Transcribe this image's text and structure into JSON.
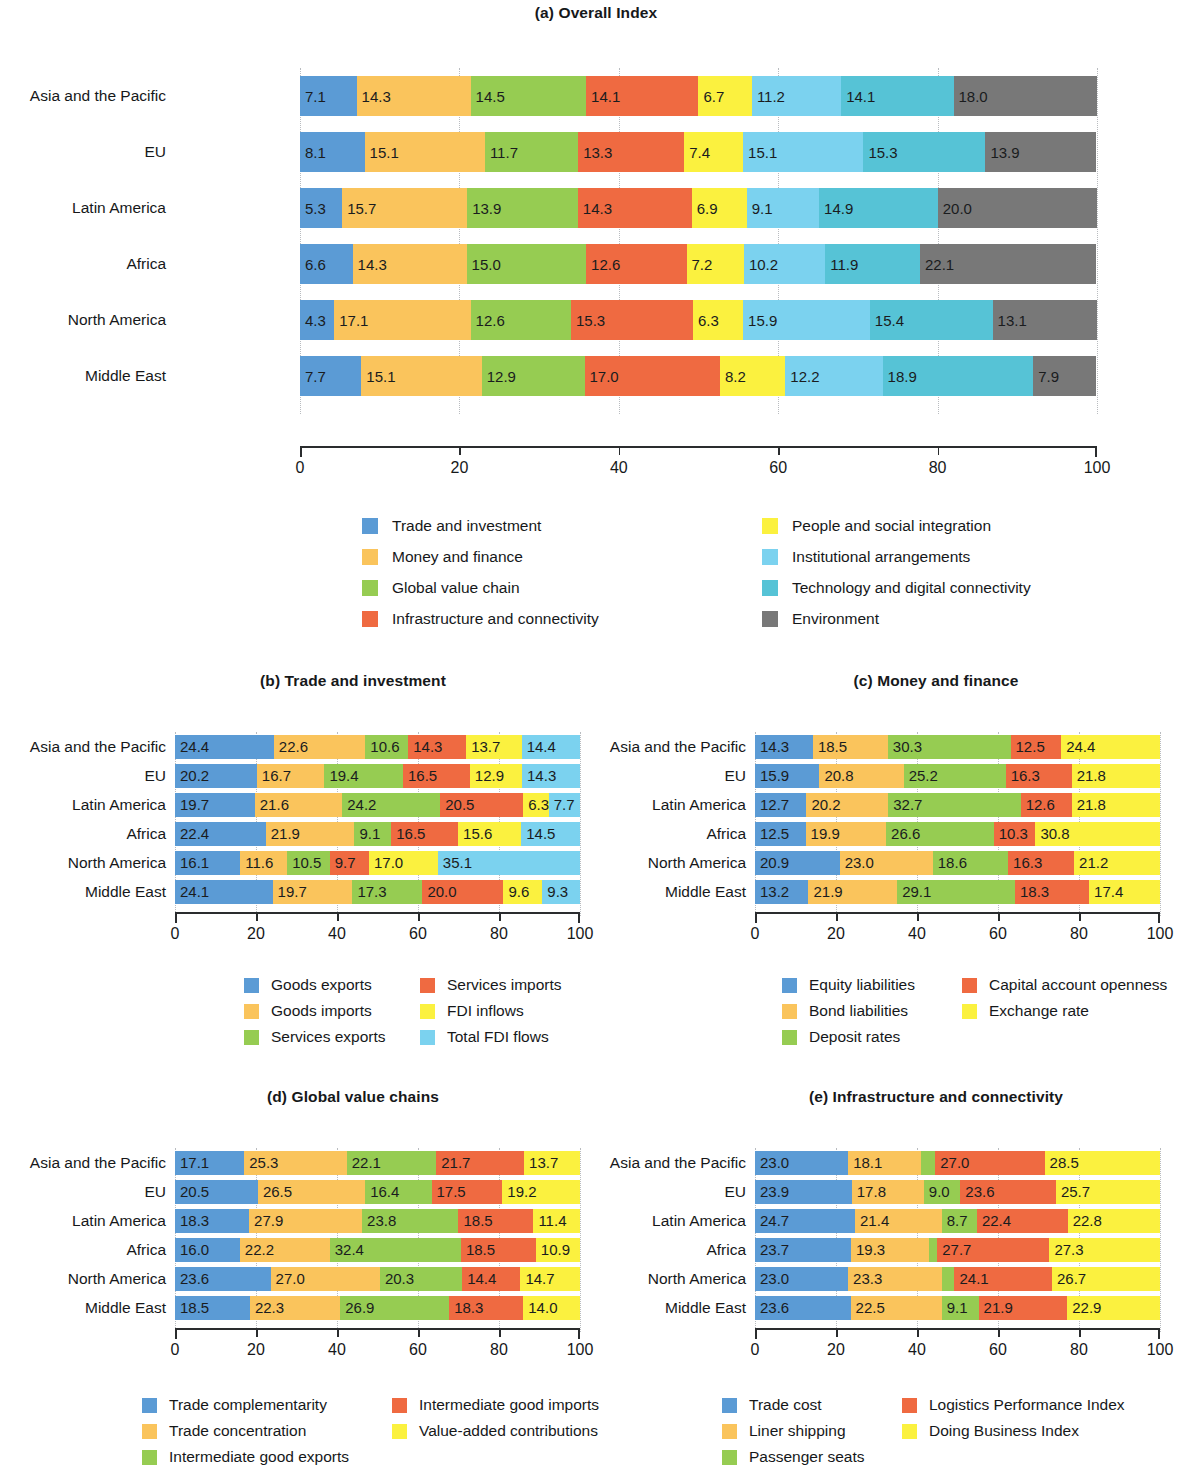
{
  "colors": {
    "blue": "#5b9bd5",
    "orange": "#fac45c",
    "green": "#96cc52",
    "red": "#ef6a41",
    "yellow": "#fbf13f",
    "lightblue": "#7bd2ef",
    "teal": "#56c3d6",
    "gray": "#787878"
  },
  "axis": {
    "ticks": [
      "0",
      "20",
      "40",
      "60",
      "80",
      "100"
    ],
    "min": 0,
    "max": 100
  },
  "regions": [
    "Asia and the Pacific",
    "EU",
    "Latin America",
    "Africa",
    "North America",
    "Middle East"
  ],
  "chart_data": [
    {
      "id": "a",
      "type": "bar",
      "orientation": "horizontal",
      "stacked": true,
      "title": "(a) Overall Index",
      "xlabel": "",
      "ylabel": "",
      "xlim": [
        0,
        100
      ],
      "grid": true,
      "legend_position": "below",
      "categories": [
        "Asia and the Pacific",
        "EU",
        "Latin America",
        "Africa",
        "North America",
        "Middle East"
      ],
      "series": [
        {
          "name": "Trade and investment",
          "color": "#5b9bd5",
          "values": [
            7.1,
            8.1,
            5.3,
            6.6,
            4.3,
            7.7
          ]
        },
        {
          "name": "Money and finance",
          "color": "#fac45c",
          "values": [
            14.3,
            15.1,
            15.7,
            14.3,
            17.1,
            15.1
          ]
        },
        {
          "name": "Global value chain",
          "color": "#96cc52",
          "values": [
            14.5,
            11.7,
            13.9,
            15.0,
            12.6,
            12.9
          ]
        },
        {
          "name": "Infrastructure and connectivity",
          "color": "#ef6a41",
          "values": [
            14.1,
            13.3,
            14.3,
            12.6,
            15.3,
            17.0
          ]
        },
        {
          "name": "People and social integration",
          "color": "#fbf13f",
          "values": [
            6.7,
            7.4,
            6.9,
            7.2,
            6.3,
            8.2
          ]
        },
        {
          "name": "Institutional arrangements",
          "color": "#7bd2ef",
          "values": [
            11.2,
            15.1,
            9.1,
            10.2,
            15.9,
            12.2
          ]
        },
        {
          "name": "Technology and digital connectivity",
          "color": "#56c3d6",
          "values": [
            14.1,
            15.3,
            14.9,
            11.9,
            15.4,
            18.9
          ]
        },
        {
          "name": "Environment",
          "color": "#787878",
          "values": [
            18.0,
            13.9,
            20.0,
            22.1,
            13.1,
            7.9
          ]
        }
      ],
      "legend": [
        {
          "label": "Trade and investment",
          "color": "#5b9bd5"
        },
        {
          "label": "Money and finance",
          "color": "#fac45c"
        },
        {
          "label": "Global value chain",
          "color": "#96cc52"
        },
        {
          "label": "Infrastructure and connectivity",
          "color": "#ef6a41"
        },
        {
          "label": "People and social integration",
          "color": "#fbf13f"
        },
        {
          "label": "Institutional arrangements",
          "color": "#7bd2ef"
        },
        {
          "label": "Technology and digital connectivity",
          "color": "#56c3d6"
        },
        {
          "label": "Environment",
          "color": "#787878"
        }
      ]
    },
    {
      "id": "b",
      "type": "bar",
      "orientation": "horizontal",
      "stacked": true,
      "title": "(b) Trade and investment",
      "xlabel": "",
      "ylabel": "",
      "xlim": [
        0,
        100
      ],
      "grid": true,
      "legend_position": "below",
      "categories": [
        "Asia and the Pacific",
        "EU",
        "Latin America",
        "Africa",
        "North America",
        "Middle East"
      ],
      "series": [
        {
          "name": "Goods exports",
          "color": "#5b9bd5",
          "values": [
            24.4,
            20.2,
            19.7,
            22.4,
            16.1,
            24.1
          ]
        },
        {
          "name": "Goods imports",
          "color": "#fac45c",
          "values": [
            22.6,
            16.7,
            21.6,
            21.9,
            11.6,
            19.7
          ]
        },
        {
          "name": "Services exports",
          "color": "#96cc52",
          "values": [
            10.6,
            19.4,
            24.2,
            9.1,
            10.5,
            17.3
          ]
        },
        {
          "name": "Services imports",
          "color": "#ef6a41",
          "values": [
            14.3,
            16.5,
            20.5,
            16.5,
            9.7,
            20.0
          ]
        },
        {
          "name": "FDI inflows",
          "color": "#fbf13f",
          "values": [
            13.7,
            12.9,
            6.3,
            15.6,
            17.0,
            9.6
          ]
        },
        {
          "name": "Total FDI flows",
          "color": "#7bd2ef",
          "values": [
            14.4,
            14.3,
            7.7,
            14.5,
            35.1,
            9.3
          ]
        }
      ],
      "legend": [
        {
          "label": "Goods exports",
          "color": "#5b9bd5"
        },
        {
          "label": "Goods imports",
          "color": "#fac45c"
        },
        {
          "label": "Services exports",
          "color": "#96cc52"
        },
        {
          "label": "Services imports",
          "color": "#ef6a41"
        },
        {
          "label": "FDI inflows",
          "color": "#fbf13f"
        },
        {
          "label": "Total FDI flows",
          "color": "#7bd2ef"
        }
      ]
    },
    {
      "id": "c",
      "type": "bar",
      "orientation": "horizontal",
      "stacked": true,
      "title": "(c) Money and finance",
      "xlabel": "",
      "ylabel": "",
      "xlim": [
        0,
        100
      ],
      "grid": true,
      "legend_position": "below",
      "categories": [
        "Asia and the Pacific",
        "EU",
        "Latin America",
        "Africa",
        "North America",
        "Middle East"
      ],
      "series": [
        {
          "name": "Equity liabilities",
          "color": "#5b9bd5",
          "values": [
            14.3,
            15.9,
            12.7,
            12.5,
            20.9,
            13.2
          ]
        },
        {
          "name": "Bond liabilities",
          "color": "#fac45c",
          "values": [
            18.5,
            20.8,
            20.2,
            19.9,
            23.0,
            21.9
          ]
        },
        {
          "name": "Deposit rates",
          "color": "#96cc52",
          "values": [
            30.3,
            25.2,
            32.7,
            26.6,
            18.6,
            29.1
          ]
        },
        {
          "name": "Capital account openness",
          "color": "#ef6a41",
          "values": [
            12.5,
            16.3,
            12.6,
            10.3,
            16.3,
            18.3
          ]
        },
        {
          "name": "Exchange rate",
          "color": "#fbf13f",
          "values": [
            24.4,
            21.8,
            21.8,
            30.8,
            21.2,
            17.4
          ]
        }
      ],
      "legend": [
        {
          "label": "Equity liabilities",
          "color": "#5b9bd5"
        },
        {
          "label": "Bond liabilities",
          "color": "#fac45c"
        },
        {
          "label": "Deposit rates",
          "color": "#96cc52"
        },
        {
          "label": "Capital account openness",
          "color": "#ef6a41"
        },
        {
          "label": "Exchange rate",
          "color": "#fbf13f"
        }
      ]
    },
    {
      "id": "d",
      "type": "bar",
      "orientation": "horizontal",
      "stacked": true,
      "title": "(d) Global value chains",
      "xlabel": "",
      "ylabel": "",
      "xlim": [
        0,
        100
      ],
      "grid": true,
      "legend_position": "below",
      "categories": [
        "Asia and the Pacific",
        "EU",
        "Latin America",
        "Africa",
        "North America",
        "Middle East"
      ],
      "series": [
        {
          "name": "Trade complementarity",
          "color": "#5b9bd5",
          "values": [
            17.1,
            20.5,
            18.3,
            16.0,
            23.6,
            18.5
          ]
        },
        {
          "name": "Trade concentration",
          "color": "#fac45c",
          "values": [
            25.3,
            26.5,
            27.9,
            22.2,
            27.0,
            22.3
          ]
        },
        {
          "name": "Intermediate good exports",
          "color": "#96cc52",
          "values": [
            22.1,
            16.4,
            23.8,
            32.4,
            20.3,
            26.9
          ]
        },
        {
          "name": "Intermediate good imports",
          "color": "#ef6a41",
          "values": [
            21.7,
            17.5,
            18.5,
            18.5,
            14.4,
            18.3
          ]
        },
        {
          "name": "Value-added contributions",
          "color": "#fbf13f",
          "values": [
            13.7,
            19.2,
            11.4,
            10.9,
            14.7,
            14.0
          ]
        }
      ],
      "legend": [
        {
          "label": "Trade complementarity",
          "color": "#5b9bd5"
        },
        {
          "label": "Trade concentration",
          "color": "#fac45c"
        },
        {
          "label": "Intermediate good exports",
          "color": "#96cc52"
        },
        {
          "label": "Intermediate good imports",
          "color": "#ef6a41"
        },
        {
          "label": "Value-added contributions",
          "color": "#fbf13f"
        }
      ]
    },
    {
      "id": "e",
      "type": "bar",
      "orientation": "horizontal",
      "stacked": true,
      "title": "(e) Infrastructure and connectivity",
      "xlabel": "",
      "ylabel": "",
      "xlim": [
        0,
        100
      ],
      "grid": true,
      "legend_position": "below",
      "categories": [
        "Asia and the Pacific",
        "EU",
        "Latin America",
        "Africa",
        "North America",
        "Middle East"
      ],
      "series": [
        {
          "name": "Trade cost",
          "color": "#5b9bd5",
          "values": [
            23.0,
            23.9,
            24.7,
            23.7,
            23.0,
            23.6
          ]
        },
        {
          "name": "Liner shipping",
          "color": "#fac45c",
          "values": [
            18.1,
            17.8,
            21.4,
            19.3,
            23.3,
            22.5
          ]
        },
        {
          "name": "Passenger seats",
          "color": "#96cc52",
          "values": [
            3.4,
            9.0,
            8.7,
            2.0,
            3.0,
            9.1
          ]
        },
        {
          "name": "Logistics Performance Index",
          "color": "#ef6a41",
          "values": [
            27.0,
            23.6,
            22.4,
            27.7,
            24.1,
            21.9
          ]
        },
        {
          "name": "Doing Business Index",
          "color": "#fbf13f",
          "values": [
            28.5,
            25.7,
            22.8,
            27.3,
            26.7,
            22.9
          ]
        }
      ],
      "legend": [
        {
          "label": "Trade cost",
          "color": "#5b9bd5"
        },
        {
          "label": "Liner shipping",
          "color": "#fac45c"
        },
        {
          "label": "Passenger seats",
          "color": "#96cc52"
        },
        {
          "label": "Logistics Performance Index",
          "color": "#ef6a41"
        },
        {
          "label": "Doing Business Index",
          "color": "#fbf13f"
        }
      ]
    }
  ],
  "hidden_value_segments": {
    "e": [
      [
        2,
        0
      ],
      [
        2,
        3
      ],
      [
        2,
        4
      ]
    ]
  }
}
